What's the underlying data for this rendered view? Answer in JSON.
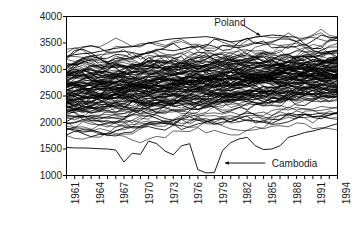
{
  "chart_data": {
    "type": "line",
    "title": "",
    "subtitle": "",
    "xlabel": "",
    "ylabel": "Caloric supply/capita/day",
    "xlim": [
      1961,
      1994
    ],
    "ylim": [
      1000,
      4000
    ],
    "grid": false,
    "legend_position": "none",
    "x_tick_labels": [
      "1961",
      "1964",
      "1967",
      "1970",
      "1973",
      "1976",
      "1979",
      "1982",
      "1985",
      "1988",
      "1991",
      "1994"
    ],
    "x_tick_values": [
      1961,
      1964,
      1967,
      1970,
      1973,
      1976,
      1979,
      1982,
      1985,
      1988,
      1991,
      1994
    ],
    "x_minor_tick_step": 1,
    "y_tick_labels": [
      "4000",
      "3500",
      "3000",
      "2500",
      "2000",
      "1500",
      "1000"
    ],
    "y_tick_values": [
      4000,
      3500,
      3000,
      2500,
      2000,
      1500,
      1000
    ],
    "line_color": "#000000",
    "line_width": 0.6,
    "axis_color": "#000000",
    "background_color": "#ffffff",
    "annotations": [
      {
        "label": "Poland",
        "text_x": 1979.0,
        "text_y": 3880,
        "arrow_from_x": 1982.4,
        "arrow_from_y": 3845,
        "arrow_to_x": 1984.6,
        "arrow_to_y": 3640,
        "arrow_direction": "down-right"
      },
      {
        "label": "Cambodia",
        "text_x": 1986.0,
        "text_y": 1235,
        "arrow_from_x": 1985.2,
        "arrow_from_y": 1235,
        "arrow_to_x": 1980.3,
        "arrow_to_y": 1235,
        "arrow_direction": "left"
      }
    ],
    "series": [
      {
        "name": "Cambodia",
        "highlighted": true,
        "x": [
          1961,
          1962,
          1963,
          1964,
          1965,
          1966,
          1967,
          1968,
          1969,
          1970,
          1971,
          1972,
          1973,
          1974,
          1975,
          1976,
          1977,
          1978,
          1979,
          1980,
          1981,
          1982,
          1983,
          1984,
          1985,
          1986,
          1987,
          1988,
          1989,
          1990,
          1991,
          1992,
          1993,
          1994
        ],
        "values": [
          1530,
          1520,
          1520,
          1515,
          1505,
          1500,
          1480,
          1255,
          1420,
          1400,
          1650,
          1600,
          1460,
          1390,
          1560,
          1600,
          1110,
          1050,
          1055,
          1470,
          1620,
          1690,
          1720,
          1560,
          1490,
          1500,
          1560,
          1720,
          1760,
          1810,
          1840,
          1880,
          1930,
          1980
        ]
      },
      {
        "name": "Poland",
        "highlighted": true,
        "x": [
          1961,
          1962,
          1963,
          1964,
          1965,
          1966,
          1967,
          1968,
          1969,
          1970,
          1971,
          1972,
          1973,
          1974,
          1975,
          1976,
          1977,
          1978,
          1979,
          1980,
          1981,
          1982,
          1983,
          1984,
          1985,
          1986,
          1987,
          1988,
          1989,
          1990,
          1991,
          1992,
          1993,
          1994
        ],
        "values": [
          3250,
          3280,
          3300,
          3310,
          3340,
          3370,
          3400,
          3420,
          3430,
          3450,
          3500,
          3530,
          3560,
          3580,
          3590,
          3600,
          3610,
          3620,
          3600,
          3560,
          3520,
          3540,
          3580,
          3610,
          3630,
          3650,
          3640,
          3620,
          3610,
          3480,
          3360,
          3310,
          3340,
          3350
        ]
      },
      {
        "name": "band_upper_envelope",
        "highlighted": false,
        "x": [
          1961,
          1964,
          1967,
          1970,
          1973,
          1976,
          1979,
          1982,
          1985,
          1988,
          1991,
          1994
        ],
        "values": [
          3550,
          3560,
          3580,
          3600,
          3620,
          3640,
          3660,
          3680,
          3700,
          3740,
          3720,
          3700
        ]
      },
      {
        "name": "band_lower_envelope",
        "highlighted": false,
        "x": [
          1961,
          1964,
          1967,
          1970,
          1973,
          1976,
          1979,
          1982,
          1985,
          1988,
          1991,
          1994
        ],
        "values": [
          1500,
          1490,
          1480,
          1500,
          1520,
          1540,
          1500,
          1520,
          1480,
          1520,
          1500,
          1490
        ]
      },
      {
        "name": "band_median",
        "highlighted": false,
        "x": [
          1961,
          1964,
          1967,
          1970,
          1973,
          1976,
          1979,
          1982,
          1985,
          1988,
          1991,
          1994
        ],
        "values": [
          2150,
          2180,
          2210,
          2250,
          2280,
          2310,
          2340,
          2370,
          2400,
          2430,
          2450,
          2470
        ]
      }
    ],
    "n_series_approx": 130,
    "series_value_range_1961": [
      1500,
      3550
    ],
    "series_value_range_1994": [
      1490,
      3700
    ]
  }
}
